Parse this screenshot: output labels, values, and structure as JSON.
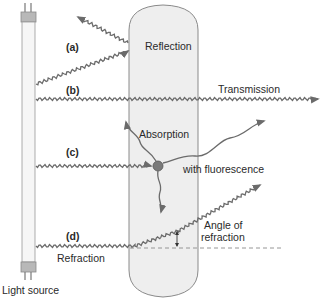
{
  "diagram": {
    "light_source": {
      "label": "Light source"
    },
    "material": {
      "label": "Material sample"
    },
    "rays": [
      {
        "id": "a",
        "tag": "(a)",
        "label": "Reflection"
      },
      {
        "id": "b",
        "tag": "(b)",
        "label": "Transmission"
      },
      {
        "id": "c",
        "tag": "(c)",
        "label": "Absorption",
        "sub_label": "with fluorescence"
      },
      {
        "id": "d",
        "tag": "(d)",
        "label": "Refraction",
        "angle_label_line1": "Angle of",
        "angle_label_line2": "refraction"
      }
    ],
    "colors": {
      "tube_fill": "#f6f6f6",
      "tube_cap": "#b8b8b8",
      "cylinder_fill": "#eeeeee",
      "outline": "#8a8a8a",
      "wave": "#6b6b6b",
      "particle": "#7a7a7a"
    }
  }
}
